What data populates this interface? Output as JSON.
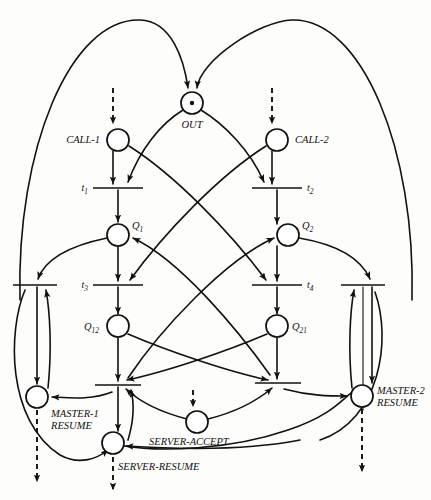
{
  "diagram": {
    "kind": "petri-net",
    "background_color": "#fdfdfc",
    "ink_color": "#111111"
  },
  "places": [
    {
      "id": "out",
      "label": "OUT",
      "cx": 192,
      "cy": 103,
      "r": 11,
      "tokens": 1,
      "label_dx": 0,
      "label_dy": 25,
      "label_anchor": "middle"
    },
    {
      "id": "call1",
      "label": "CALL-1",
      "cx": 118,
      "cy": 140,
      "r": 11,
      "tokens": 0,
      "label_dx": -16,
      "label_dy": 3,
      "label_anchor": "end"
    },
    {
      "id": "call2",
      "label": "CALL-2",
      "cx": 277,
      "cy": 140,
      "r": 11,
      "tokens": 0,
      "label_dx": 16,
      "label_dy": 3,
      "label_anchor": "start"
    },
    {
      "id": "q1",
      "label": "Q1",
      "cx": 118,
      "cy": 235,
      "r": 11,
      "tokens": 0,
      "label_dx": 14,
      "label_dy": -6,
      "label_anchor": "start"
    },
    {
      "id": "q2",
      "label": "Q2",
      "cx": 288,
      "cy": 235,
      "r": 11,
      "tokens": 0,
      "label_dx": 14,
      "label_dy": -6,
      "label_anchor": "start"
    },
    {
      "id": "q12",
      "label": "Q12",
      "cx": 118,
      "cy": 326,
      "r": 11,
      "tokens": 0,
      "label_dx": -15,
      "label_dy": 3,
      "label_anchor": "end"
    },
    {
      "id": "q21",
      "label": "Q21",
      "cx": 277,
      "cy": 326,
      "r": 11,
      "tokens": 0,
      "label_dx": 15,
      "label_dy": 3,
      "label_anchor": "start"
    },
    {
      "id": "master1resume",
      "label": "MASTER-1 RESUME",
      "cx": 37,
      "cy": 397,
      "r": 11,
      "tokens": 0,
      "label_dx": 14,
      "label_dy": 18,
      "label_anchor": "start"
    },
    {
      "id": "master2resume",
      "label": "MASTER-2 RESUME",
      "cx": 362,
      "cy": 396,
      "r": 11,
      "tokens": 0,
      "label_dx": 15,
      "label_dy": -1,
      "label_anchor": "start"
    },
    {
      "id": "serveraccept",
      "label": "SERVER-ACCEPT",
      "cx": 197,
      "cy": 422,
      "r": 11,
      "tokens": 0,
      "label_dx": -48,
      "label_dy": 23,
      "label_anchor": "start"
    },
    {
      "id": "serverresume",
      "label": "SERVER-RESUME",
      "cx": 113,
      "cy": 443,
      "r": 11,
      "tokens": 0,
      "label_dx": 2,
      "label_dy": 26,
      "label_anchor": "start"
    }
  ],
  "place_labels_multiline": {
    "master1resume": [
      "MASTER-1",
      "RESUME"
    ],
    "master2resume": [
      "MASTER-2",
      "RESUME"
    ]
  },
  "transitions": [
    {
      "id": "t1",
      "label": "t1",
      "cx": 118,
      "cy": 188,
      "half_width": 25,
      "label_dx": -30,
      "label_dy": 3,
      "label_anchor": "end"
    },
    {
      "id": "t2",
      "label": "t2",
      "cx": 277,
      "cy": 188,
      "half_width": 25,
      "label_dx": 30,
      "label_dy": 3,
      "label_anchor": "start"
    },
    {
      "id": "t3",
      "label": "t3",
      "cx": 118,
      "cy": 285,
      "half_width": 25,
      "label_dx": -30,
      "label_dy": 3,
      "label_anchor": "end"
    },
    {
      "id": "t4",
      "label": "t4",
      "cx": 277,
      "cy": 285,
      "half_width": 25,
      "label_dx": 30,
      "label_dy": 3,
      "label_anchor": "start"
    },
    {
      "id": "t5",
      "label": "",
      "cx": 35,
      "cy": 285,
      "half_width": 22,
      "label_dx": 0,
      "label_dy": 0,
      "label_anchor": "middle"
    },
    {
      "id": "t6",
      "label": "",
      "cx": 363,
      "cy": 285,
      "half_width": 22,
      "label_dx": 0,
      "label_dy": 0,
      "label_anchor": "middle"
    },
    {
      "id": "t7",
      "label": "",
      "cx": 118,
      "cy": 385,
      "half_width": 23,
      "label_dx": 0,
      "label_dy": 0,
      "label_anchor": "middle"
    },
    {
      "id": "t8",
      "label": "",
      "cx": 278,
      "cy": 383,
      "half_width": 23,
      "label_dx": 0,
      "label_dy": 0,
      "label_anchor": "middle"
    }
  ],
  "transition_labels": {
    "t1": {
      "base": "t",
      "sub": "1"
    },
    "t2": {
      "base": "t",
      "sub": "2"
    },
    "t3": {
      "base": "t",
      "sub": "3"
    },
    "t4": {
      "base": "t",
      "sub": "4"
    }
  },
  "place_sublabels": {
    "q1": {
      "base": "Q",
      "sub": "1"
    },
    "q2": {
      "base": "Q",
      "sub": "2"
    },
    "q12": {
      "base": "Q",
      "sub": "12"
    },
    "q21": {
      "base": "Q",
      "sub": "21"
    }
  },
  "notes": {
    "token_description": "single black token dot inside OUT place",
    "dashed_arcs": "dashed arrows denote external / environment inputs and outputs",
    "outer_arcs": "two large outer arcs return from the bottom transitions up to the OUT place"
  }
}
